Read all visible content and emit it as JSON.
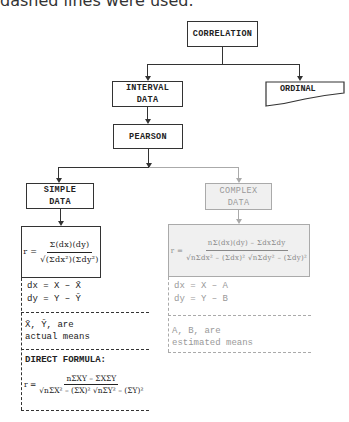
{
  "caption": "dashed lines were used.",
  "nodes": {
    "correlation": "CORRELATION",
    "interval_line1": "INTERVAL",
    "interval_line2": "DATA",
    "ordinal": "ORDINAL",
    "pearson": "PEARSON",
    "simple_line1": "SIMPLE",
    "simple_line2": "DATA",
    "complex_line1": "COMPLEX",
    "complex_line2": "DATA"
  },
  "simple": {
    "formula": {
      "lhs": "r =",
      "num": "Σ(dx)(dy)",
      "den": "√(Σdx²)(Σdy²)"
    },
    "dx": "dx  =  X  –  X̄",
    "dy": "dy  =  Y  –  Ȳ",
    "means_line1": "X̄, Ȳ, are",
    "means_line2": "actual means",
    "direct_label": "DIRECT FORMULA:",
    "direct_formula": {
      "lhs": "r =",
      "num": "nΣXY – ΣXΣY",
      "den": "√nΣX² – (ΣX)²  √nΣY² – (ΣY)²"
    }
  },
  "complex": {
    "formula": {
      "lhs": "r =",
      "num": "nΣ(dx)(dy) – ΣdxΣdy",
      "den": "√nΣdx² – (Σdx)²  √nΣdy² – (Σdy)²"
    },
    "dx": "dx  =  X – A",
    "dy": "dy  =  Y – B",
    "means_line1": "A,  B,  are",
    "means_line2": "estimated means"
  },
  "colors": {
    "primary": "#333333",
    "muted": "#aaaaaa",
    "muted_fill": "#f0f0f0"
  }
}
